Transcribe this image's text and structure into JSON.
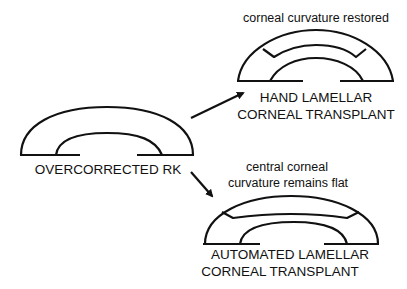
{
  "diagram": {
    "source": {
      "label": "OVERCORRECTED RK"
    },
    "outcomes": [
      {
        "caption": "corneal curvature restored",
        "label_lines": [
          "HAND LAMELLAR",
          "CORNEAL TRANSPLANT"
        ]
      },
      {
        "caption_lines": [
          "central corneal",
          "curvature remains flat"
        ],
        "label_lines": [
          "AUTOMATED LAMELLAR",
          "CORNEAL TRANSPLANT"
        ]
      }
    ],
    "arrows": [
      {
        "from": "OVERCORRECTED RK",
        "to": "HAND LAMELLAR CORNEAL TRANSPLANT"
      },
      {
        "from": "OVERCORRECTED RK",
        "to": "AUTOMATED LAMELLAR CORNEAL TRANSPLANT"
      }
    ],
    "colors": {
      "stroke": "#111111",
      "background": "#ffffff"
    }
  }
}
